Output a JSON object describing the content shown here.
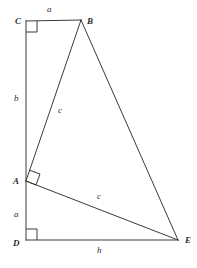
{
  "diagram": {
    "type": "geometry-figure",
    "background_color": "#ffffff",
    "stroke_color": "#3a3a3a",
    "text_color": "#2b2b2b",
    "canvas": {
      "width": 197,
      "height": 268
    },
    "vertices": [
      {
        "id": "C",
        "label": "C",
        "x": 26,
        "y": 21,
        "label_x": 15,
        "label_y": 17
      },
      {
        "id": "B",
        "label": "B",
        "x": 81,
        "y": 20,
        "label_x": 87,
        "label_y": 17
      },
      {
        "id": "A",
        "label": "A",
        "x": 26,
        "y": 181,
        "label_x": 13,
        "label_y": 177
      },
      {
        "id": "D",
        "label": "D",
        "x": 26,
        "y": 240,
        "label_x": 13,
        "label_y": 239
      },
      {
        "id": "E",
        "label": "E",
        "x": 178,
        "y": 240,
        "label_x": 185,
        "label_y": 236
      }
    ],
    "segments": [
      {
        "id": "CB",
        "from": "C",
        "to": "B",
        "x1": 26,
        "y1": 21,
        "x2": 81,
        "y2": 20
      },
      {
        "id": "CA",
        "from": "C",
        "to": "A",
        "x1": 26,
        "y1": 21,
        "x2": 26,
        "y2": 181
      },
      {
        "id": "AD",
        "from": "A",
        "to": "D",
        "x1": 26,
        "y1": 181,
        "x2": 26,
        "y2": 240
      },
      {
        "id": "DE",
        "from": "D",
        "to": "E",
        "x1": 26,
        "y1": 240,
        "x2": 178,
        "y2": 240
      },
      {
        "id": "AB",
        "from": "A",
        "to": "B",
        "x1": 26,
        "y1": 181,
        "x2": 81,
        "y2": 20
      },
      {
        "id": "BE",
        "from": "B",
        "to": "E",
        "x1": 81,
        "y1": 20,
        "x2": 178,
        "y2": 240
      },
      {
        "id": "AE",
        "from": "A",
        "to": "E",
        "x1": 26,
        "y1": 181,
        "x2": 178,
        "y2": 240
      }
    ],
    "right_angles": [
      {
        "id": "angle-C",
        "at": "C",
        "points": "26,32 37,32 37,21"
      },
      {
        "id": "angle-D",
        "at": "D",
        "points": "26,229 37,229 37,240"
      },
      {
        "id": "angle-A",
        "at": "A",
        "points": "29,170 40,174 36,185 26,181"
      }
    ],
    "side_labels": [
      {
        "id": "label-a-top",
        "text": "a",
        "for": "CB",
        "x": 47,
        "y": 5
      },
      {
        "id": "label-b-left",
        "text": "b",
        "for": "CA",
        "x": 14,
        "y": 94
      },
      {
        "id": "label-c-ab",
        "text": "c",
        "for": "AB",
        "x": 58,
        "y": 106
      },
      {
        "id": "label-a-lower",
        "text": "a",
        "for": "AD",
        "x": 14,
        "y": 210
      },
      {
        "id": "label-c-ae",
        "text": "c",
        "for": "AE",
        "x": 97,
        "y": 192
      },
      {
        "id": "label-h-bottom",
        "text": "h",
        "for": "DE",
        "x": 97,
        "y": 246
      }
    ]
  }
}
